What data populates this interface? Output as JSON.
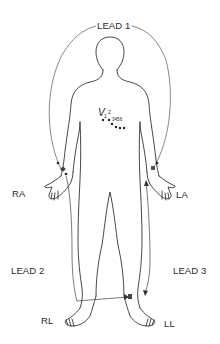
{
  "diagram": {
    "leads": [
      {
        "name": "lead-1",
        "label": "LEAD 1",
        "from": "RA",
        "to": "LA"
      },
      {
        "name": "lead-2",
        "label": "LEAD 2",
        "from": "RA",
        "to": "RL"
      },
      {
        "name": "lead-3",
        "label": "LEAD 3",
        "from": "LA",
        "to": "LL"
      }
    ],
    "electrodes": {
      "ra": "RA",
      "la": "LA",
      "rl": "RL",
      "ll": "LL"
    },
    "chest": {
      "prefix": "V",
      "first": "1",
      "second": "2",
      "rest": "3 4 5 6",
      "labels": [
        "V1",
        "V2",
        "V3",
        "V4",
        "V5",
        "V6"
      ]
    },
    "colors": {
      "line": "#333333",
      "lead_wire": "#666666",
      "text": "#2a2a2a",
      "background": "#ffffff"
    }
  }
}
